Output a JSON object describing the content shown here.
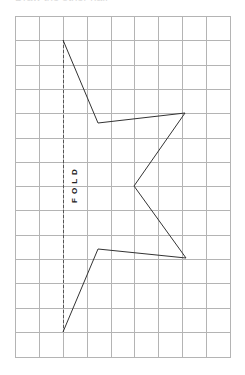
{
  "caption": {
    "text": "Draw the other half"
  },
  "grid": {
    "columns": 9,
    "rows": 14,
    "x_lines": [
      15,
      39,
      63,
      87,
      111,
      134,
      158,
      182,
      206,
      230
    ],
    "y_lines": [
      16,
      40,
      65,
      89,
      113,
      138,
      162,
      186,
      210,
      235,
      259,
      283,
      308,
      332,
      357
    ],
    "line_color": "#b4b4b4"
  },
  "fold_line": {
    "label": "FOLD",
    "x": 63,
    "y_start": 40,
    "y_end": 332,
    "color": "#555555"
  },
  "shape": {
    "points": [
      [
        63,
        40
      ],
      [
        98,
        123
      ],
      [
        185,
        113
      ],
      [
        134,
        186
      ],
      [
        186,
        258
      ],
      [
        98,
        249
      ],
      [
        63,
        332
      ]
    ],
    "stroke": "#333333"
  }
}
